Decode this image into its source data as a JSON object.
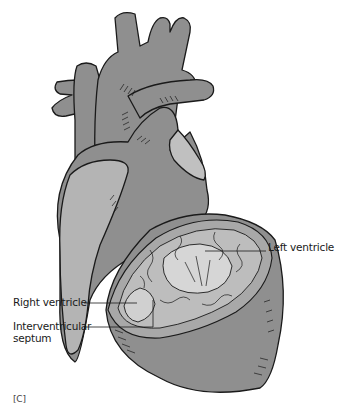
{
  "figure": {
    "panel_label": "[C]",
    "colors": {
      "muscle": "#8f8f8f",
      "muscle_light": "#b4b4b4",
      "inner_surface": "#cfcfcf",
      "outline": "#1a1a1a",
      "background": "#ffffff"
    },
    "labels": [
      {
        "id": "left-ventricle",
        "text": "Left ventricle"
      },
      {
        "id": "right-ventricle",
        "text": "Right ventricle"
      },
      {
        "id": "interventricular-septum",
        "text": "Interventricular septum"
      }
    ]
  }
}
